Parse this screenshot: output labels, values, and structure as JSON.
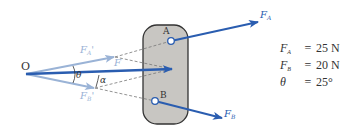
{
  "figure": {
    "origin_label": "O",
    "pin_a_label": "A",
    "pin_b_label": "B",
    "force_a_label": {
      "main": "F",
      "sub": "A"
    },
    "force_b_label": {
      "main": "F",
      "sub": "B"
    },
    "force_a_prime_label": {
      "main": "F",
      "sub": "A",
      "prime": "'"
    },
    "force_b_prime_label": {
      "main": "F",
      "sub": "B",
      "prime": "'"
    },
    "resultant_label": "F",
    "theta_label": "θ",
    "alpha_label": "α"
  },
  "given": [
    {
      "symbol": "F",
      "sub": "A",
      "eq": "=",
      "value": "25 N"
    },
    {
      "symbol": "F",
      "sub": "B",
      "eq": "=",
      "value": "20 N"
    },
    {
      "symbol": "θ",
      "sub": "",
      "eq": "=",
      "value": "25°"
    }
  ],
  "colors": {
    "force_blue": "#2a5db0",
    "light_blue": "#9ab3d6",
    "plate_fill": "#c8c6c2",
    "plate_stroke": "#333333",
    "dashed": "#777777",
    "text": "#333333"
  }
}
